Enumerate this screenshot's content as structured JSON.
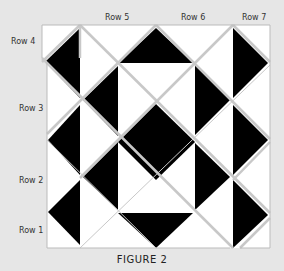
{
  "figure": {
    "caption": "FIGURE 2",
    "row_labels": {
      "row1": "Row 1",
      "row2": "Row 2",
      "row3": "Row 3",
      "row4": "Row 4",
      "row5": "Row 5",
      "row6": "Row 6",
      "row7": "Row 7"
    },
    "colors": {
      "background": "#e6e6e6",
      "dark": "#000000",
      "light": "#ffffff",
      "seam": "#c8c8c8"
    }
  }
}
